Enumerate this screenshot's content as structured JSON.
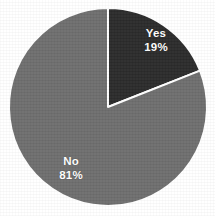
{
  "chart_data": {
    "type": "pie",
    "title": "",
    "subtitle": "",
    "xlabel": "",
    "ylabel": "",
    "legend": "none",
    "grid": false,
    "start_angle_deg": 0,
    "direction": "clockwise",
    "categories": [
      "Yes",
      "No"
    ],
    "values": [
      19,
      81
    ],
    "unit": "%",
    "slices": [
      {
        "label": "Yes",
        "value": 19,
        "value_text": "19%",
        "color": "#2b2b2b",
        "start_deg": 0,
        "end_deg": 68.4,
        "label_color": "#ffffff"
      },
      {
        "label": "No",
        "value": 81,
        "value_text": "81%",
        "color": "#6e6e6e",
        "start_deg": 68.4,
        "end_deg": 360,
        "label_color": "#ffffff"
      }
    ],
    "separator_color": "#ffffff",
    "background_color": "#ffffff"
  },
  "geometry": {
    "center_x": 108,
    "center_y": 107,
    "radius": 99,
    "separator_width": 2
  }
}
